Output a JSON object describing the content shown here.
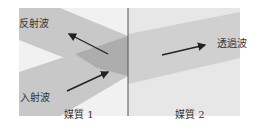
{
  "diagram": {
    "labels": {
      "reflected": "反射波",
      "incident": "入射波",
      "transmitted": "透過波",
      "medium1": "媒質 1",
      "medium2": "媒質 2"
    },
    "colors": {
      "medium1_bg": "#f1f1f1",
      "medium2_bg": "#e7e7e7",
      "band": "#c8c8c8",
      "overlap": "#adadad",
      "transmitted_band": "#cfcfcf",
      "boundary": "#555555",
      "arrow": "#222222"
    }
  }
}
